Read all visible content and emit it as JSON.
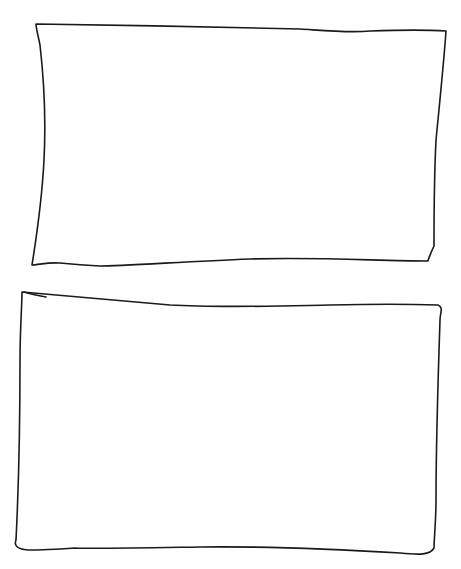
{
  "canvas": {
    "width": 461,
    "height": 569,
    "background": "#ffffff",
    "stroke_color": "#1a1a1a"
  },
  "shapes": [
    {
      "name": "top-rectangle",
      "kind": "hand-drawn-rectangle",
      "filled": false,
      "label": "",
      "path": "M36,24 C120,25 220,27 300,29 C330,31 350,33 370,31 C400,30 430,30 446,31 C444,60 440,100 436,140 C434,180 434,220 434,246 C432,250 428,260 428,261 C380,261 320,257 250,259 C180,262 120,266 100,266 C80,265 70,264 60,263 C48,262 38,265 32,265 C36,240 42,200 44,160 C46,120 44,80 40,45 C38,35 36,28 36,24 Z"
    },
    {
      "name": "bottom-rectangle",
      "kind": "hand-drawn-rectangle",
      "filled": false,
      "label": "",
      "path": "M22,292 C60,295 110,300 170,305 C220,308 280,306 330,305 C370,304 410,304 438,305 C444,308 440,312 440,320 C438,380 436,440 436,500 C436,520 434,540 434,548 C430,555 420,555 400,553 C350,550 280,546 200,547 C140,548 90,549 75,548 C60,549 40,550 28,550 C16,549 14,545 16,540 C18,500 20,420 20,360 C20,330 22,305 22,292 Z",
      "tick_path": "M24,292 C30,294 40,296 46,297"
    }
  ]
}
